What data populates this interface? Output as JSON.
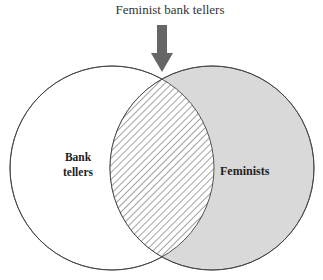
{
  "diagram": {
    "type": "venn",
    "title": "Feminist bank tellers",
    "sets": [
      {
        "name": "Bank tellers",
        "label_line1": "Bank",
        "label_line2": "tellers",
        "fill": "#ffffff"
      },
      {
        "name": "Feminists",
        "label": "Feminists",
        "fill": "#d9d9d9"
      }
    ],
    "intersection": {
      "name": "Feminist bank tellers",
      "pattern": "diagonal-hatch"
    },
    "arrow": {
      "direction": "down",
      "color": "#666666",
      "points_to": "intersection"
    }
  }
}
